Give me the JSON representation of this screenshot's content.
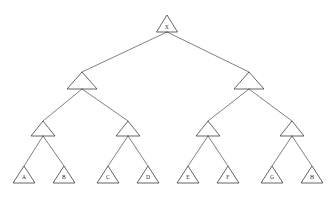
{
  "diagram": {
    "background_color": "#ffffff",
    "line_color": "#3d3d3d",
    "edge_color": "#4a4a4a",
    "label_color": "#1f1f1f",
    "node_shape": "triangle",
    "depth": 4,
    "leaf_count": 8
  },
  "nodes": {
    "root": {
      "id": "root",
      "label": "X",
      "level": 1,
      "cx": 167,
      "apex_y": 15,
      "base_y": 32,
      "half_width": 10.5,
      "label_y": 27.5
    },
    "level2": [
      {
        "id": "n2-left",
        "label": "",
        "level": 2,
        "cx": 82,
        "apex_y": 72,
        "base_y": 89,
        "half_width": 15
      },
      {
        "id": "n2-right",
        "label": "",
        "level": 2,
        "cx": 249,
        "apex_y": 72,
        "base_y": 89,
        "half_width": 15
      }
    ],
    "level3": [
      {
        "id": "n3-a",
        "label": "",
        "level": 3,
        "cx": 43,
        "apex_y": 121,
        "base_y": 136,
        "half_width": 12
      },
      {
        "id": "n3-b",
        "label": "",
        "level": 3,
        "cx": 128,
        "apex_y": 121,
        "base_y": 136,
        "half_width": 12
      },
      {
        "id": "n3-c",
        "label": "",
        "level": 3,
        "cx": 208,
        "apex_y": 121,
        "base_y": 136,
        "half_width": 12
      },
      {
        "id": "n3-d",
        "label": "",
        "level": 3,
        "cx": 292,
        "apex_y": 121,
        "base_y": 136,
        "half_width": 12
      }
    ],
    "leaves": [
      {
        "id": "leaf-a",
        "label": "A",
        "level": 4,
        "cx": 24,
        "apex_y": 166,
        "base_y": 183,
        "half_width": 11,
        "label_y": 178
      },
      {
        "id": "leaf-b",
        "label": "B",
        "level": 4,
        "cx": 64,
        "apex_y": 166,
        "base_y": 183,
        "half_width": 11,
        "label_y": 178
      },
      {
        "id": "leaf-c",
        "label": "C",
        "level": 4,
        "cx": 108,
        "apex_y": 166,
        "base_y": 183,
        "half_width": 11,
        "label_y": 178
      },
      {
        "id": "leaf-d",
        "label": "D",
        "level": 4,
        "cx": 148,
        "apex_y": 166,
        "base_y": 183,
        "half_width": 11,
        "label_y": 178
      },
      {
        "id": "leaf-e",
        "label": "E",
        "level": 4,
        "cx": 188,
        "apex_y": 166,
        "base_y": 183,
        "half_width": 11,
        "label_y": 178
      },
      {
        "id": "leaf-f",
        "label": "F",
        "level": 4,
        "cx": 228,
        "apex_y": 166,
        "base_y": 183,
        "half_width": 11,
        "label_y": 178
      },
      {
        "id": "leaf-g",
        "label": "G",
        "level": 4,
        "cx": 272,
        "apex_y": 166,
        "base_y": 183,
        "half_width": 11,
        "label_y": 178
      },
      {
        "id": "leaf-h",
        "label": "H",
        "level": 4,
        "cx": 312,
        "apex_y": 166,
        "base_y": 183,
        "half_width": 11,
        "label_y": 178
      }
    ]
  },
  "edges": [
    {
      "id": "e-root-l",
      "from": "root",
      "to": "n2-left",
      "x1": 167,
      "y1": 32,
      "x2": 82,
      "y2": 72
    },
    {
      "id": "e-root-r",
      "from": "root",
      "to": "n2-right",
      "x1": 167,
      "y1": 32,
      "x2": 249,
      "y2": 72
    },
    {
      "id": "e-n2l-a",
      "from": "n2-left",
      "to": "n3-a",
      "x1": 82,
      "y1": 89,
      "x2": 43,
      "y2": 121
    },
    {
      "id": "e-n2l-b",
      "from": "n2-left",
      "to": "n3-b",
      "x1": 82,
      "y1": 89,
      "x2": 128,
      "y2": 121
    },
    {
      "id": "e-n2r-c",
      "from": "n2-right",
      "to": "n3-c",
      "x1": 249,
      "y1": 89,
      "x2": 208,
      "y2": 121
    },
    {
      "id": "e-n2r-d",
      "from": "n2-right",
      "to": "n3-d",
      "x1": 249,
      "y1": 89,
      "x2": 292,
      "y2": 121
    },
    {
      "id": "e-n3a-A",
      "from": "n3-a",
      "to": "leaf-a",
      "x1": 43,
      "y1": 136,
      "x2": 24,
      "y2": 166
    },
    {
      "id": "e-n3a-B",
      "from": "n3-a",
      "to": "leaf-b",
      "x1": 43,
      "y1": 136,
      "x2": 64,
      "y2": 166
    },
    {
      "id": "e-n3b-C",
      "from": "n3-b",
      "to": "leaf-c",
      "x1": 128,
      "y1": 136,
      "x2": 108,
      "y2": 166
    },
    {
      "id": "e-n3b-D",
      "from": "n3-b",
      "to": "leaf-d",
      "x1": 128,
      "y1": 136,
      "x2": 148,
      "y2": 166
    },
    {
      "id": "e-n3c-E",
      "from": "n3-c",
      "to": "leaf-e",
      "x1": 208,
      "y1": 136,
      "x2": 188,
      "y2": 166
    },
    {
      "id": "e-n3c-F",
      "from": "n3-c",
      "to": "leaf-f",
      "x1": 208,
      "y1": 136,
      "x2": 228,
      "y2": 166
    },
    {
      "id": "e-n3d-G",
      "from": "n3-d",
      "to": "leaf-g",
      "x1": 292,
      "y1": 136,
      "x2": 272,
      "y2": 166
    },
    {
      "id": "e-n3d-H",
      "from": "n3-d",
      "to": "leaf-h",
      "x1": 292,
      "y1": 136,
      "x2": 312,
      "y2": 166
    }
  ]
}
